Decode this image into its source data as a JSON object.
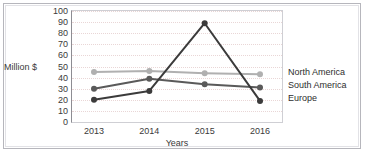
{
  "chart_data": {
    "type": "line",
    "title": "",
    "xlabel": "Years",
    "ylabel": "Million $",
    "categories": [
      "2013",
      "2014",
      "2015",
      "2016"
    ],
    "ylim": [
      0,
      100
    ],
    "yticks": [
      "0",
      "10",
      "20",
      "30",
      "40",
      "50",
      "60",
      "70",
      "80",
      "90",
      "100"
    ],
    "grid": true,
    "legend_position": "right",
    "series": [
      {
        "name": "North America",
        "color": "#b0b0b0",
        "values": [
          45,
          46,
          44,
          43
        ]
      },
      {
        "name": "South America",
        "color": "#5a5a5a",
        "values": [
          30,
          39,
          34,
          31
        ]
      },
      {
        "name": "Europe",
        "color": "#3b3b3b",
        "values": [
          20,
          28,
          89,
          19
        ]
      }
    ]
  },
  "axes": {
    "y_axis_label": "Million $",
    "x_axis_label": "Years"
  },
  "legend": {
    "items": [
      {
        "label": "North America"
      },
      {
        "label": "South America"
      },
      {
        "label": "Europe"
      }
    ]
  }
}
